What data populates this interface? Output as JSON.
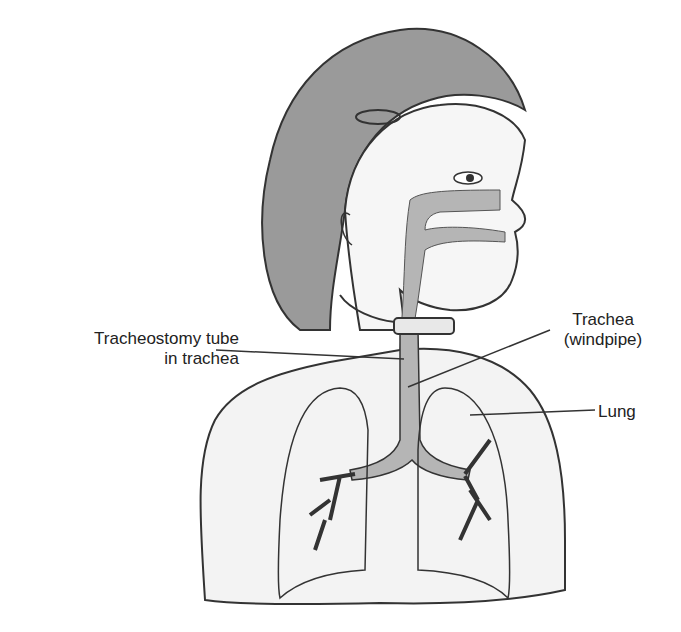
{
  "figure": {
    "colors": {
      "skin": "#f3f3f3",
      "hair": "#9a9a9a",
      "airway": "#b5b5b5",
      "outline": "#333333",
      "background": "#ffffff"
    }
  },
  "labels": {
    "tracheostomy_tube_line1": "Tracheostomy tube",
    "tracheostomy_tube_line2": "in trachea",
    "trachea_line1": "Trachea",
    "trachea_line2": "(windpipe)",
    "lung": "Lung"
  }
}
